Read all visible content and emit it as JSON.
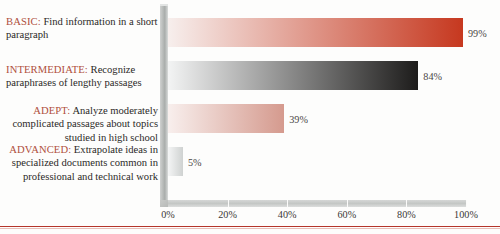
{
  "chart_data": {
    "type": "bar",
    "orientation": "horizontal",
    "title": "",
    "xlabel": "",
    "ylabel": "",
    "xlim": [
      0,
      100
    ],
    "grid": false,
    "legend": "none",
    "categories": [
      "BASIC",
      "INTERMEDIATE",
      "ADEPT",
      "ADVANCED"
    ],
    "values": [
      99,
      84,
      39,
      5
    ],
    "value_labels": [
      "99%",
      "84%",
      "39%",
      "5%"
    ],
    "tick_labels": [
      "0%",
      "20%",
      "40%",
      "60%",
      "80%",
      "100%"
    ],
    "tick_values": [
      0,
      20,
      40,
      60,
      80,
      100
    ],
    "bar_colors": [
      {
        "name": "basic-red-gradient",
        "from": "#f7efed",
        "to": "#c6381f"
      },
      {
        "name": "intermediate-gray-gradient",
        "from": "#f3f4f4",
        "to": "#1d1c1b"
      },
      {
        "name": "adept-rose-gradient",
        "from": "#f8efed",
        "to": "#d59a8e"
      },
      {
        "name": "advanced-gray-gradient",
        "from": "#f4f5f5",
        "to": "#cfd2d1"
      }
    ],
    "accent_color": "#b5352b",
    "level_label_color": "#b0503c"
  },
  "legend": {
    "items": [
      {
        "level": "BASIC:",
        "description": " Find information in a short paragraph",
        "align": "left"
      },
      {
        "level": "INTERMEDIATE:",
        "description": " Recognize paraphrases of lengthy passages",
        "align": "left"
      },
      {
        "level": "ADEPT:",
        "description": " Analyze moderately complicated passages about topics studied in high school",
        "align": "right"
      },
      {
        "level": "ADVANCED:",
        "description": " Extrapolate ideas in specialized documents common in professional and technical work",
        "align": "right"
      }
    ]
  }
}
